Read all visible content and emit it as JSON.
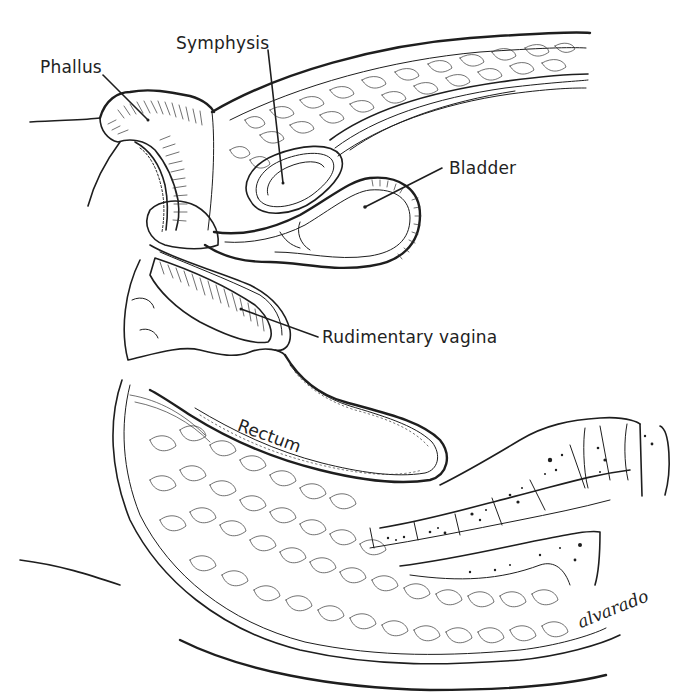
{
  "figure": {
    "type": "anatomical-illustration",
    "view": "sagittal section of pelvis",
    "ink_color": "#1e1e1e",
    "background": "#ffffff"
  },
  "labels": [
    {
      "id": "phallus",
      "text": "Phallus",
      "x": 40,
      "y": 57,
      "pointer": {
        "from": [
          103,
          75
        ],
        "to": [
          148,
          120
        ]
      }
    },
    {
      "id": "symphysis",
      "text": "Symphysis",
      "x": 176,
      "y": 33,
      "pointer": {
        "from": [
          268,
          50
        ],
        "to": [
          283,
          183
        ]
      }
    },
    {
      "id": "bladder",
      "text": "Bladder",
      "x": 449,
      "y": 158,
      "pointer": {
        "from": [
          442,
          168
        ],
        "to": [
          365,
          207
        ]
      }
    },
    {
      "id": "rudimentary-vagina",
      "text": "Rudimentary vagina",
      "x": 322,
      "y": 327,
      "pointer": {
        "from": [
          318,
          337
        ],
        "to": [
          241,
          309
        ]
      }
    },
    {
      "id": "rectum",
      "text": "Rectum",
      "x": 242,
      "y": 415,
      "rotation": 20
    }
  ],
  "signature": {
    "text": "alvarado",
    "x": 582,
    "y": 625
  }
}
